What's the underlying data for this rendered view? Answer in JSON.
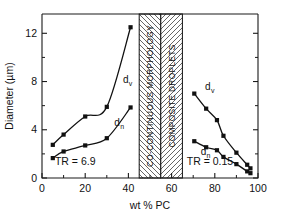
{
  "chart_data": {
    "type": "scatter",
    "title": "",
    "xlabel": "wt % PC",
    "ylabel": "Diameter (µm)",
    "xlim": [
      0,
      100
    ],
    "ylim": [
      0,
      13.6
    ],
    "grid": false,
    "legend": "inline-curve-labels",
    "xticks": [
      0,
      20,
      40,
      60,
      80,
      100
    ],
    "xticklabels": [
      "0",
      "20",
      "40",
      "60",
      "80",
      "100"
    ],
    "xminorticks": [
      10,
      30,
      50,
      70,
      90
    ],
    "yticks": [
      0,
      4,
      8,
      12
    ],
    "yticklabels": [
      "0",
      "4",
      "8",
      "12"
    ],
    "yminorticks": [
      2,
      6,
      10
    ],
    "series": [
      {
        "name": "d_v",
        "label": "d",
        "sub": "v",
        "region": "left",
        "label_x": 37.5,
        "label_y": 7.9,
        "points": [
          {
            "x": 5,
            "y": 2.75
          },
          {
            "x": 10,
            "y": 3.6
          },
          {
            "x": 20,
            "y": 5.1
          },
          {
            "x": 30,
            "y": 5.9
          },
          {
            "x": 41,
            "y": 12.5
          }
        ]
      },
      {
        "name": "d_n",
        "label": "d",
        "sub": "n",
        "region": "left",
        "label_x": 33.5,
        "label_y": 4.35,
        "points": [
          {
            "x": 5,
            "y": 1.65
          },
          {
            "x": 10,
            "y": 2.2
          },
          {
            "x": 20,
            "y": 2.7
          },
          {
            "x": 30,
            "y": 3.3
          },
          {
            "x": 41,
            "y": 5.85
          }
        ]
      },
      {
        "name": "d_v",
        "label": "d",
        "sub": "v",
        "region": "right",
        "label_x": 75.5,
        "label_y": 7.3,
        "points": [
          {
            "x": 70.5,
            "y": 7.0
          },
          {
            "x": 76,
            "y": 5.75
          },
          {
            "x": 81,
            "y": 4.8
          },
          {
            "x": 84,
            "y": 3.5
          },
          {
            "x": 90,
            "y": 2.1
          },
          {
            "x": 95,
            "y": 1.1
          },
          {
            "x": 96.5,
            "y": 0.8
          }
        ]
      },
      {
        "name": "d_n",
        "label": "d",
        "sub": "n",
        "region": "right",
        "label_x": 73.5,
        "label_y": 1.9,
        "points": [
          {
            "x": 70.5,
            "y": 3.05
          },
          {
            "x": 76,
            "y": 2.55
          },
          {
            "x": 81,
            "y": 2.3
          },
          {
            "x": 84,
            "y": 1.75
          },
          {
            "x": 90,
            "y": 1.15
          },
          {
            "x": 95,
            "y": 0.55
          },
          {
            "x": 96.5,
            "y": 0.4
          }
        ]
      }
    ],
    "annotations": [
      {
        "name": "tr-left",
        "text": "TR = 6.9",
        "x": 6,
        "y": 1.05
      },
      {
        "name": "tr-right",
        "text": "TR = 0.15",
        "x": 67,
        "y": 1.05
      }
    ],
    "bands": [
      {
        "name": "co-continuous-morphology",
        "text": "CO-CONTINUOUS  MORPHOLOGY",
        "x0": 45,
        "x1": 55,
        "hatch": "down"
      },
      {
        "name": "composite-droplets",
        "text": "COMPOSITE  DROPLETS",
        "x0": 55,
        "x1": 65,
        "hatch": "up"
      }
    ]
  }
}
